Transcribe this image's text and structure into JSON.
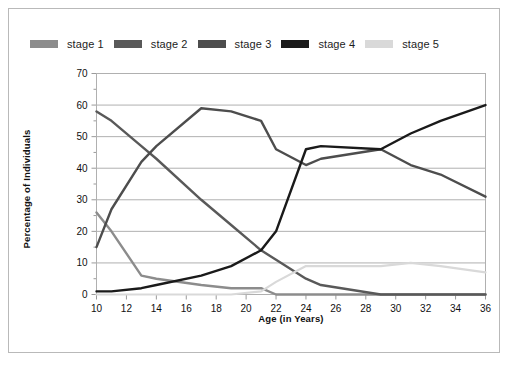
{
  "chart_data": {
    "type": "line",
    "title": "",
    "subtitle": "",
    "xlabel": "Age (in Years)",
    "ylabel": "Percentage of Individuals",
    "xlim": [
      10,
      36
    ],
    "ylim": [
      0,
      70
    ],
    "xticks": [
      10,
      12,
      14,
      16,
      18,
      20,
      22,
      24,
      26,
      28,
      30,
      32,
      34,
      36
    ],
    "xtick_labels": [
      "10",
      "12",
      "14",
      "16",
      "18",
      "20",
      "22",
      "24",
      "26",
      "28",
      "30",
      "32",
      "34",
      "36"
    ],
    "yticks": [
      0,
      10,
      20,
      30,
      40,
      50,
      60,
      70
    ],
    "ytick_labels": [
      "0",
      "10",
      "20",
      "30",
      "40",
      "50",
      "60",
      "70"
    ],
    "y_minor_ticks": [
      5,
      15,
      25,
      35,
      45,
      55,
      65
    ],
    "grid": "horizontal",
    "legend_position": "top",
    "x": [
      10,
      11,
      13,
      14,
      17,
      19,
      21,
      22,
      24,
      25,
      29,
      31,
      33,
      36
    ],
    "series": [
      {
        "name": "stage 1",
        "color": "#8c8c8c",
        "values": [
          26,
          20,
          6,
          5,
          3,
          2,
          2,
          0,
          0,
          0,
          0,
          0,
          0,
          0
        ]
      },
      {
        "name": "stage 2",
        "color": "#595959",
        "values": [
          58,
          55,
          47,
          43,
          30,
          22,
          14,
          11,
          5,
          3,
          0,
          0,
          0,
          0
        ]
      },
      {
        "name": "stage 3",
        "color": "#4d4d4d",
        "values": [
          15,
          27,
          42,
          47,
          59,
          58,
          55,
          46,
          41,
          43,
          46,
          41,
          38,
          31
        ]
      },
      {
        "name": "stage 4",
        "color": "#1a1a1a",
        "values": [
          1,
          1,
          2,
          3,
          6,
          9,
          14,
          20,
          46,
          47,
          46,
          51,
          55,
          60
        ]
      },
      {
        "name": "stage 5",
        "color": "#d9d9d9",
        "values": [
          0,
          0,
          0,
          0,
          0,
          0,
          1,
          4,
          9,
          9,
          9,
          10,
          9,
          7
        ]
      }
    ],
    "annotations": []
  },
  "legend": {
    "items": [
      {
        "label": "stage 1",
        "color": "#8c8c8c"
      },
      {
        "label": "stage 2",
        "color": "#595959"
      },
      {
        "label": "stage 3",
        "color": "#4d4d4d"
      },
      {
        "label": "stage 4",
        "color": "#1a1a1a"
      },
      {
        "label": "stage 5",
        "color": "#d9d9d9"
      }
    ]
  },
  "axes": {
    "x_title": "Age (in Years)",
    "y_title": "Percentage of Individuals"
  },
  "colors": {
    "background": "#ffffff",
    "frame": "#b9b9b9",
    "gridline": "#b0b0b0",
    "axis": "#9a9a9a",
    "text": "#101010"
  }
}
